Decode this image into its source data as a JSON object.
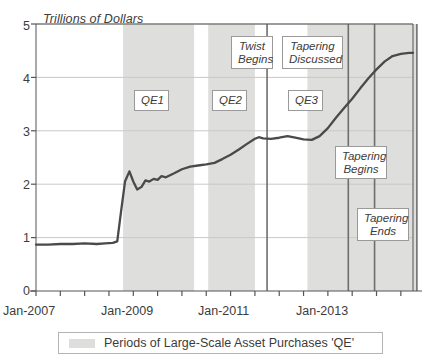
{
  "chart_data": {
    "type": "line",
    "title": "",
    "ylabel": "Trillions of Dollars",
    "xlabel": "",
    "ylim": [
      0,
      5
    ],
    "ytick_labels": [
      "0",
      "1",
      "2",
      "3",
      "4",
      "5"
    ],
    "ytick_values": [
      0,
      1,
      2,
      3,
      4,
      5
    ],
    "xtick_labels": [
      "Jan-2007",
      "Jan-2009",
      "Jan-2011",
      "Jan-2013"
    ],
    "xtick_values": [
      2007.0,
      2009.0,
      2011.0,
      2013.0
    ],
    "xlim": [
      2007.0,
      2014.75
    ],
    "grid": "horizontal",
    "legend_position": "bottom",
    "legend": [
      {
        "label": "Periods of Large-Scale Asset Purchases 'QE'",
        "color": "#dededc",
        "type": "band"
      }
    ],
    "series": [
      {
        "name": "Federal Reserve Balance Sheet",
        "color": "#4a4a4a",
        "x": [
          2007.0,
          2007.25,
          2007.5,
          2007.75,
          2008.0,
          2008.25,
          2008.42,
          2008.58,
          2008.67,
          2008.75,
          2008.83,
          2008.92,
          2009.0,
          2009.08,
          2009.17,
          2009.25,
          2009.33,
          2009.42,
          2009.5,
          2009.58,
          2009.67,
          2009.83,
          2010.0,
          2010.17,
          2010.33,
          2010.5,
          2010.67,
          2010.83,
          2011.0,
          2011.17,
          2011.33,
          2011.5,
          2011.58,
          2011.67,
          2011.83,
          2012.0,
          2012.17,
          2012.33,
          2012.5,
          2012.67,
          2012.83,
          2013.0,
          2013.17,
          2013.33,
          2013.5,
          2013.67,
          2013.83,
          2014.0,
          2014.17,
          2014.33,
          2014.5,
          2014.67,
          2014.75
        ],
        "y": [
          0.87,
          0.87,
          0.88,
          0.88,
          0.89,
          0.88,
          0.89,
          0.9,
          0.93,
          1.5,
          2.05,
          2.24,
          2.05,
          1.9,
          1.95,
          2.07,
          2.05,
          2.1,
          2.08,
          2.15,
          2.13,
          2.2,
          2.28,
          2.33,
          2.35,
          2.37,
          2.4,
          2.47,
          2.55,
          2.65,
          2.75,
          2.85,
          2.88,
          2.86,
          2.85,
          2.87,
          2.9,
          2.87,
          2.84,
          2.83,
          2.9,
          3.05,
          3.25,
          3.42,
          3.6,
          3.8,
          3.98,
          4.15,
          4.3,
          4.4,
          4.44,
          4.46,
          4.46
        ]
      }
    ],
    "shaded_bands": [
      {
        "label": "QE1",
        "start": 2008.79,
        "end": 2010.25
      },
      {
        "label": "QE2",
        "start": 2010.54,
        "end": 2011.5
      },
      {
        "label": "QE3",
        "start": 2012.58,
        "end": 2014.83
      }
    ],
    "vertical_lines": [
      {
        "label": "Twist Begins",
        "x": 2011.75
      },
      {
        "label": "Tapering Discussed",
        "x": 2013.42
      },
      {
        "label": "Tapering Begins",
        "x": 2013.96
      },
      {
        "label": "Tapering Ends",
        "x": 2014.83
      }
    ],
    "band_labels": [
      {
        "text": "QE1",
        "x": 150,
        "y": 92
      },
      {
        "text": "QE2",
        "x": 225,
        "y": 92
      },
      {
        "text": "QE3",
        "x": 297,
        "y": 92
      }
    ],
    "annotations": [
      {
        "text": "Twist\nBegins",
        "x": 236,
        "y": 38
      },
      {
        "text": "Tapering\nDiscussed",
        "x": 287,
        "y": 38
      },
      {
        "text": "Tapering\nBegins",
        "x": 339,
        "y": 147
      },
      {
        "text": "Tapering\nEnds",
        "x": 360,
        "y": 209
      }
    ]
  },
  "colors": {
    "band": "#dededc",
    "line": "#4a4a4a",
    "axis": "#555555",
    "grid": "#c9c9c9",
    "vline": "#6e6e6e",
    "text": "#3c3c3c",
    "background": "#ffffff"
  }
}
